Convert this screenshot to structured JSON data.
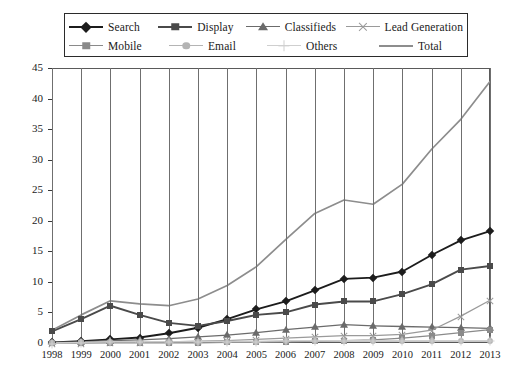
{
  "chart_data": {
    "type": "line",
    "title": "",
    "subtitle": "",
    "xlabel": "",
    "ylabel": "",
    "x": [
      1998,
      1999,
      2000,
      2001,
      2002,
      2003,
      2004,
      2005,
      2006,
      2007,
      2008,
      2009,
      2010,
      2011,
      2012,
      2013
    ],
    "xtick_labels": [
      "1998",
      "1999",
      "2000",
      "2001",
      "2002",
      "2003",
      "2004",
      "2005",
      "2006",
      "2007",
      "2008",
      "2009",
      "2010",
      "2011",
      "2012",
      "2013"
    ],
    "ytick_labels": [
      "0",
      "5",
      "10",
      "15",
      "20",
      "25",
      "30",
      "35",
      "40",
      "45"
    ],
    "ylim": [
      0,
      45
    ],
    "ytick_step": 5,
    "grid": "vertical",
    "legend_position": "top",
    "series": [
      {
        "name": "Search",
        "marker": "diamond",
        "color": "#1c1c1c",
        "values": [
          0.1,
          0.3,
          0.6,
          0.9,
          1.6,
          2.5,
          3.9,
          5.5,
          6.8,
          8.6,
          10.5,
          10.7,
          11.7,
          14.4,
          16.8,
          18.3
        ]
      },
      {
        "name": "Display",
        "marker": "square",
        "color": "#4a4a4a",
        "values": [
          1.9,
          3.9,
          6.1,
          4.6,
          3.3,
          2.8,
          3.6,
          4.6,
          5.0,
          6.3,
          6.8,
          6.8,
          8.0,
          9.6,
          12.0,
          12.6
        ]
      },
      {
        "name": "Classifieds",
        "marker": "triangle",
        "color": "#6b6b6b",
        "values": [
          0.1,
          0.2,
          0.4,
          0.5,
          0.7,
          1.0,
          1.3,
          1.7,
          2.2,
          2.6,
          3.0,
          2.8,
          2.7,
          2.6,
          2.5,
          2.4
        ]
      },
      {
        "name": "Lead Generation",
        "marker": "cross",
        "color": "#9a9a9a",
        "values": [
          0.0,
          0.0,
          0.1,
          0.1,
          0.2,
          0.3,
          0.4,
          0.6,
          0.8,
          1.0,
          1.2,
          1.2,
          1.4,
          2.1,
          4.4,
          7.0
        ]
      },
      {
        "name": "Mobile",
        "marker": "square",
        "color": "#8a8a8a",
        "values": [
          0.0,
          0.0,
          0.0,
          0.0,
          0.0,
          0.0,
          0.1,
          0.1,
          0.2,
          0.3,
          0.4,
          0.5,
          0.8,
          1.2,
          1.7,
          2.2
        ]
      },
      {
        "name": "Email",
        "marker": "circle",
        "color": "#b4b4b4",
        "values": [
          0.0,
          0.1,
          0.2,
          0.2,
          0.2,
          0.2,
          0.2,
          0.2,
          0.3,
          0.3,
          0.3,
          0.3,
          0.3,
          0.3,
          0.3,
          0.3
        ]
      },
      {
        "name": "Others",
        "marker": "plus",
        "color": "#cfcfcf",
        "values": [
          0.0,
          0.1,
          0.2,
          0.2,
          0.2,
          0.2,
          0.3,
          0.3,
          0.4,
          0.4,
          0.4,
          0.4,
          0.4,
          0.4,
          0.4,
          0.4
        ]
      },
      {
        "name": "Total",
        "marker": "none",
        "color": "#8d8d8d",
        "values": [
          2.1,
          4.6,
          6.9,
          6.4,
          6.1,
          7.2,
          9.4,
          12.5,
          16.9,
          21.2,
          23.4,
          22.7,
          26.0,
          31.7,
          36.6,
          42.8
        ]
      }
    ]
  },
  "legend": {
    "rows": [
      [
        {
          "label": "Search"
        },
        {
          "label": "Display"
        },
        {
          "label": "Classifieds"
        },
        {
          "label": "Lead Generation"
        }
      ],
      [
        {
          "label": "Mobile"
        },
        {
          "label": "Email"
        },
        {
          "label": "Others"
        },
        {
          "label": "Total"
        }
      ]
    ]
  }
}
